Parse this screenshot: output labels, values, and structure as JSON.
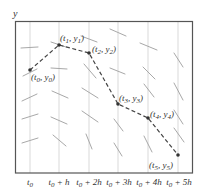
{
  "diagram": {
    "y_axis_label": "y",
    "colors": {
      "frame": "#555555",
      "grid": "#c8c8c8",
      "slope": "#a8a8a8",
      "path": "#444444",
      "point": "#333333",
      "text": "#333333"
    },
    "x_ticks": [
      {
        "base": "t",
        "sub": "0",
        "suffix": ""
      },
      {
        "base": "t",
        "sub": "0",
        "suffix": " + h"
      },
      {
        "base": "t",
        "sub": "0",
        "suffix": " + 2h"
      },
      {
        "base": "t",
        "sub": "0",
        "suffix": " + 3h"
      },
      {
        "base": "t",
        "sub": "0",
        "suffix": " + 4h"
      },
      {
        "base": "t",
        "sub": "0",
        "suffix": " + 5h"
      }
    ],
    "points": [
      {
        "label_t": "t",
        "label_ts": "0",
        "label_y": "y",
        "label_ys": "0",
        "x": 30,
        "y": 70
      },
      {
        "label_t": "t",
        "label_ts": "1",
        "label_y": "y",
        "label_ys": "1",
        "x": 59,
        "y": 45
      },
      {
        "label_t": "t",
        "label_ts": "2",
        "label_y": "y",
        "label_ys": "2",
        "x": 89,
        "y": 53
      },
      {
        "label_t": "t",
        "label_ts": "3",
        "label_y": "y",
        "label_ys": "3",
        "x": 118,
        "y": 104
      },
      {
        "label_t": "t",
        "label_ts": "4",
        "label_y": "y",
        "label_ys": "4",
        "x": 148,
        "y": 118
      },
      {
        "label_t": "t",
        "label_ts": "5",
        "label_y": "y",
        "label_ys": "5",
        "x": 178,
        "y": 155
      }
    ]
  }
}
